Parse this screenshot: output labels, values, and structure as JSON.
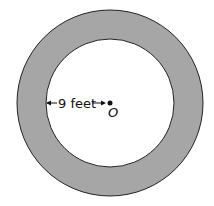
{
  "diagram": {
    "radius_label": "9 feet",
    "center_label": "O",
    "colors": {
      "ring_fill": "#a6a6a6",
      "stroke": "#222222",
      "inner_fill": "#ffffff"
    }
  }
}
